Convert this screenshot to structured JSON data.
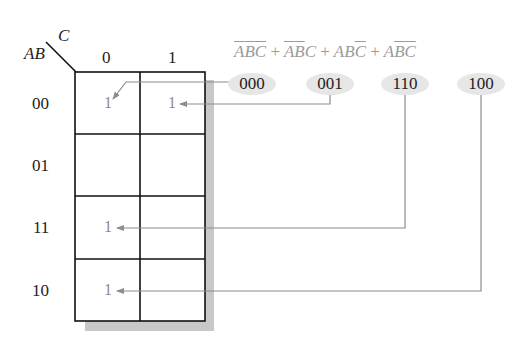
{
  "kmap": {
    "corner_row_var": "AB",
    "corner_col_var": "C",
    "col_headers": [
      "0",
      "1"
    ],
    "row_headers": [
      "00",
      "01",
      "11",
      "10"
    ],
    "cells": [
      [
        "1",
        "1"
      ],
      [
        "",
        ""
      ],
      [
        "1",
        ""
      ],
      [
        "1",
        ""
      ]
    ]
  },
  "expression": {
    "terms": [
      {
        "A": "A",
        "B": "B",
        "C": "C",
        "bars": "A'B'C'"
      },
      {
        "A": "A",
        "B": "B",
        "C": "C",
        "bars": "A'B'C"
      },
      {
        "A": "A",
        "B": "B",
        "C": "C",
        "bars": "ABC'"
      },
      {
        "A": "A",
        "B": "B",
        "C": "C",
        "bars": "AB'C'"
      }
    ],
    "plus": "+"
  },
  "minterms": [
    {
      "code": "000",
      "target_cell": "00-0"
    },
    {
      "code": "001",
      "target_cell": "00-1"
    },
    {
      "code": "110",
      "target_cell": "11-0"
    },
    {
      "code": "100",
      "target_cell": "10-0"
    }
  ],
  "colors": {
    "grid": "#111111",
    "shadow": "#c8c8c8",
    "arrow": "#8c8c8c",
    "oval": "#e6e6e6"
  }
}
